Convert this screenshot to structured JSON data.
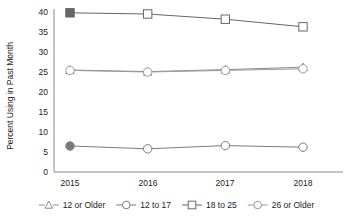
{
  "chart_data": {
    "type": "line",
    "title": "",
    "xlabel": "",
    "ylabel": "Percent Using in Past Month",
    "categories": [
      "2015",
      "2016",
      "2017",
      "2018"
    ],
    "x": [
      2015,
      2016,
      2017,
      2018
    ],
    "ylim": [
      0,
      40
    ],
    "yticks": [
      0,
      5,
      10,
      15,
      20,
      25,
      30,
      35,
      40
    ],
    "ytick_labels": [
      "0",
      "5",
      "10",
      "15",
      "20",
      "25",
      "30",
      "35",
      "40"
    ],
    "grid": false,
    "legend_position": "bottom",
    "series": [
      {
        "name": "12 or Older",
        "marker": "triangle-open",
        "color": "#8c8c8c",
        "values": [
          25.5,
          25.1,
          25.6,
          26.2
        ]
      },
      {
        "name": "12 to 17",
        "marker": "circle-open",
        "color": "#7a7a7a",
        "values": [
          6.5,
          5.8,
          6.6,
          6.2
        ]
      },
      {
        "name": "18 to 25",
        "marker": "square-open",
        "color": "#666666",
        "values": [
          39.8,
          39.5,
          38.2,
          36.3
        ]
      },
      {
        "name": "26 or Older",
        "marker": "circle-open",
        "color": "#9a9a9a",
        "values": [
          25.4,
          25.0,
          25.4,
          25.8
        ]
      }
    ]
  },
  "axis": {
    "y_title": "Percent Using in Past Month",
    "y_ticks": [
      "40",
      "35",
      "30",
      "25",
      "20",
      "15",
      "10",
      "5",
      "0"
    ],
    "x_ticks": [
      "2015",
      "2016",
      "2017",
      "2018"
    ]
  },
  "legend": {
    "items": [
      {
        "label": "12 or Older",
        "marker": "triangle-open-icon",
        "color": "#8c8c8c"
      },
      {
        "label": "12 to 17",
        "marker": "circle-open-icon",
        "color": "#7a7a7a"
      },
      {
        "label": "18 to 25",
        "marker": "square-open-icon",
        "color": "#666666"
      },
      {
        "label": "26 or Older",
        "marker": "circle-open-icon",
        "color": "#9a9a9a"
      }
    ]
  }
}
